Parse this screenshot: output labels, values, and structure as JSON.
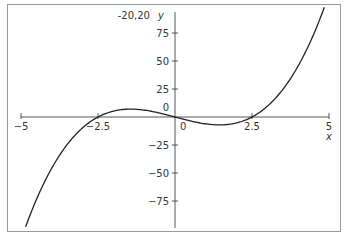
{
  "chart_data": {
    "type": "line",
    "title": "",
    "corner_label": "-20,20",
    "xlabel": "x",
    "ylabel": "y",
    "xlim": [
      -5,
      5
    ],
    "ylim": [
      -100,
      100
    ],
    "grid": false,
    "legend": null,
    "x_ticks": [
      {
        "value": -5,
        "label": "−5"
      },
      {
        "value": -2.5,
        "label": "−2.5"
      },
      {
        "value": 0,
        "label": "0"
      },
      {
        "value": 2.5,
        "label": "2.5"
      },
      {
        "value": 5,
        "label": "5"
      }
    ],
    "y_ticks": [
      {
        "value": 75,
        "label": "75"
      },
      {
        "value": 50,
        "label": "50"
      },
      {
        "value": 25,
        "label": "25"
      },
      {
        "value": 0,
        "label": "0"
      },
      {
        "value": -25,
        "label": "−25"
      },
      {
        "value": -50,
        "label": "−50"
      },
      {
        "value": -75,
        "label": "−75"
      }
    ],
    "series": [
      {
        "name": "cubic",
        "description": "y = a·x(x² − 6.25), roots at -2.5, 0, 2.5",
        "coefficient": 1.17,
        "roots": [
          -2.5,
          0,
          2.5
        ],
        "x_range": [
          -4.85,
          4.85
        ],
        "points": [
          {
            "x": -4.85,
            "y": -98
          },
          {
            "x": -4,
            "y": -45
          },
          {
            "x": -3,
            "y": -9.7
          },
          {
            "x": -2.5,
            "y": 0
          },
          {
            "x": -1.44,
            "y": 7
          },
          {
            "x": 0,
            "y": 0
          },
          {
            "x": 1.44,
            "y": -7
          },
          {
            "x": 2.5,
            "y": 0
          },
          {
            "x": 3,
            "y": 9.7
          },
          {
            "x": 4,
            "y": 45
          },
          {
            "x": 4.85,
            "y": 98
          }
        ]
      }
    ]
  }
}
